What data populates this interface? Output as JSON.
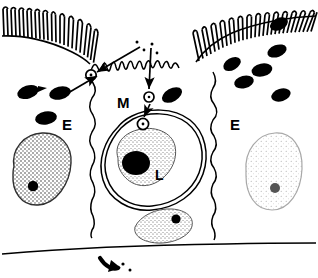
{
  "figure": {
    "kind": "scientific-line-drawing",
    "background_color": "#ffffff",
    "ink_color": "#000000",
    "width": 318,
    "height": 278
  },
  "labels": {
    "epithelial_cell_left": "E",
    "epithelial_cell_right": "E",
    "m_cell": "M",
    "lymphocyte": "L"
  },
  "structures": {
    "brush_border_left": "microvilli-brush-border-left",
    "brush_border_right": "microvilli-brush-border-right",
    "m_cell_apical_surface": "m-cell-microfold-apex",
    "basement_membrane": "basement-membrane-line",
    "lymphocyte_pocket": "lymphocyte-in-m-cell-pocket",
    "bacteria_left_count": 3,
    "bacteria_right_count": 6,
    "vesicle_count": 3,
    "arrow_count": 4,
    "particle_dot_count": 6
  },
  "colors": {
    "ink": "#000000",
    "nucleus_stipple_dark": "#3a3a3a",
    "nucleus_stipple_light": "#9a9a9a",
    "paper": "#ffffff"
  }
}
